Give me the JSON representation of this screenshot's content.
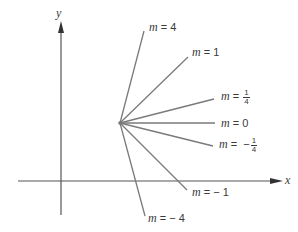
{
  "diagram": {
    "axes": {
      "x_label": "x",
      "y_label": "y"
    },
    "hub_point": {
      "x": 120,
      "y": 123
    },
    "line_color": "#7a7a7a",
    "axis_color": "#555555",
    "lines": [
      {
        "slope": "4",
        "label_var": "m",
        "label_eq": "=",
        "label_value": "4",
        "frac": null,
        "end": [
          144,
          31
        ]
      },
      {
        "slope": "1",
        "label_var": "m",
        "label_eq": "=",
        "label_value": "1",
        "frac": null,
        "end": [
          188,
          57
        ]
      },
      {
        "slope": "1/4",
        "label_var": "m",
        "label_eq": "=",
        "label_value": "",
        "frac": {
          "sign": "",
          "num": "1",
          "den": "4"
        },
        "end": [
          214,
          99
        ]
      },
      {
        "slope": "0",
        "label_var": "m",
        "label_eq": "=",
        "label_value": "0",
        "frac": null,
        "end": [
          215,
          123
        ]
      },
      {
        "slope": "-1/4",
        "label_var": "m",
        "label_eq": "=",
        "label_value": "",
        "frac": {
          "sign": "−",
          "num": "1",
          "den": "4"
        },
        "end": [
          213,
          146
        ]
      },
      {
        "slope": "-1",
        "label_var": "m",
        "label_eq": "=",
        "label_value": "− 1",
        "frac": null,
        "end": [
          187,
          190
        ]
      },
      {
        "slope": "-4",
        "label_var": "m",
        "label_eq": "=",
        "label_value": "− 4",
        "frac": null,
        "end": [
          145,
          216
        ]
      }
    ]
  }
}
